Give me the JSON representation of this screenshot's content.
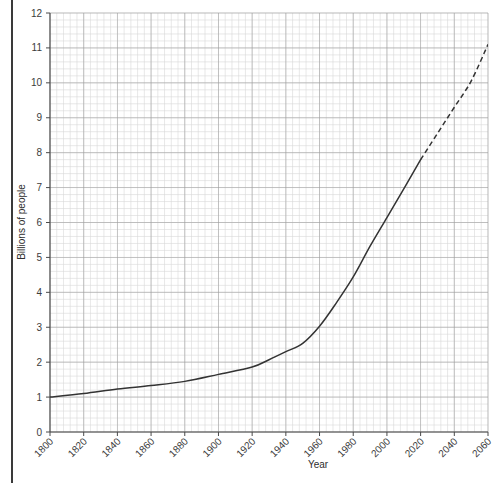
{
  "chart_data": {
    "type": "line",
    "title": "",
    "xlabel": "Year",
    "ylabel": "Billions of people",
    "xlim": [
      1800,
      2060
    ],
    "ylim": [
      0,
      12
    ],
    "grid": "graph-paper minor and major gridlines",
    "legend": "none",
    "x_ticks": [
      1800,
      1820,
      1840,
      1860,
      1880,
      1900,
      1920,
      1940,
      1960,
      1980,
      2000,
      2020,
      2040,
      2060
    ],
    "y_ticks": [
      0,
      1,
      2,
      3,
      4,
      5,
      6,
      7,
      8,
      9,
      10,
      11,
      12
    ],
    "x_tick_labels": [
      "1800",
      "1820",
      "1840",
      "1860",
      "1880",
      "1900",
      "1920",
      "1940",
      "1960",
      "1980",
      "2000",
      "2020",
      "2040",
      "2060"
    ],
    "y_tick_labels": [
      "0",
      "1",
      "2",
      "3",
      "4",
      "5",
      "6",
      "7",
      "8",
      "9",
      "10",
      "11",
      "12"
    ],
    "x_tick_rotation": 45,
    "series": [
      {
        "name": "Historical population",
        "style": "solid",
        "color": "#333333",
        "x": [
          1800,
          1820,
          1840,
          1860,
          1880,
          1900,
          1920,
          1930,
          1940,
          1950,
          1960,
          1970,
          1980,
          1990,
          2000,
          2010,
          2020
        ],
        "values": [
          1.0,
          1.1,
          1.23,
          1.33,
          1.45,
          1.65,
          1.86,
          2.07,
          2.3,
          2.54,
          3.03,
          3.7,
          4.44,
          5.32,
          6.14,
          6.96,
          7.8
        ]
      },
      {
        "name": "Projected population",
        "style": "dashed",
        "color": "#333333",
        "x": [
          2020,
          2030,
          2040,
          2050,
          2060
        ],
        "values": [
          7.8,
          8.55,
          9.3,
          10.05,
          11.1
        ]
      }
    ],
    "annotations": [
      "Solid line covers 1800 through 2020 (observed)",
      "Dashed line covers 2020 through 2060 (projection)"
    ],
    "colors": {
      "line": "#333333",
      "major_grid": "#9a9a9a",
      "minor_grid": "#d8d8d8",
      "axis": "#4a4a4a",
      "text": "#3c3c3c",
      "page_edge": "#3a3a3a",
      "background": "#ffffff"
    }
  }
}
